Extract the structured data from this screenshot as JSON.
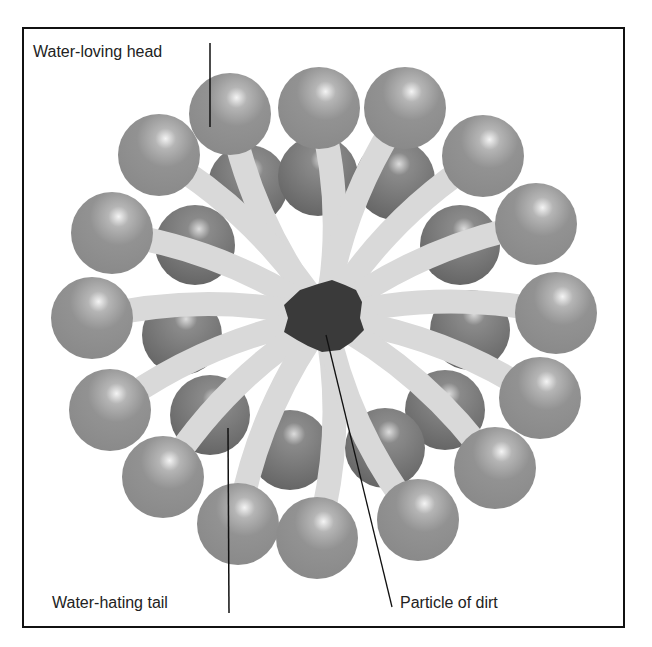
{
  "diagram": {
    "labels": {
      "head": "Water-loving head",
      "tail": "Water-hating tail",
      "dirt": "Particle of dirt"
    },
    "colors": {
      "head": "#8e8e8e",
      "head_back": "#6f6f6f",
      "tail": "#d9d9d9",
      "dirt": "#3a3a3a",
      "border": "#111111",
      "leader_line": "#111111"
    },
    "center": [
      325,
      318
    ],
    "outer_heads": [
      [
        230,
        114
      ],
      [
        319,
        108
      ],
      [
        405,
        108
      ],
      [
        159,
        155
      ],
      [
        483,
        156
      ],
      [
        112,
        233
      ],
      [
        536,
        224
      ],
      [
        92,
        318
      ],
      [
        556,
        313
      ],
      [
        110,
        410
      ],
      [
        540,
        398
      ],
      [
        163,
        477
      ],
      [
        495,
        468
      ],
      [
        238,
        524
      ],
      [
        317,
        538
      ],
      [
        418,
        520
      ]
    ],
    "inner_heads": [
      [
        248,
        185
      ],
      [
        318,
        176
      ],
      [
        395,
        180
      ],
      [
        195,
        245
      ],
      [
        460,
        245
      ],
      [
        182,
        335
      ],
      [
        470,
        330
      ],
      [
        210,
        415
      ],
      [
        445,
        410
      ],
      [
        290,
        450
      ],
      [
        385,
        448
      ]
    ]
  }
}
